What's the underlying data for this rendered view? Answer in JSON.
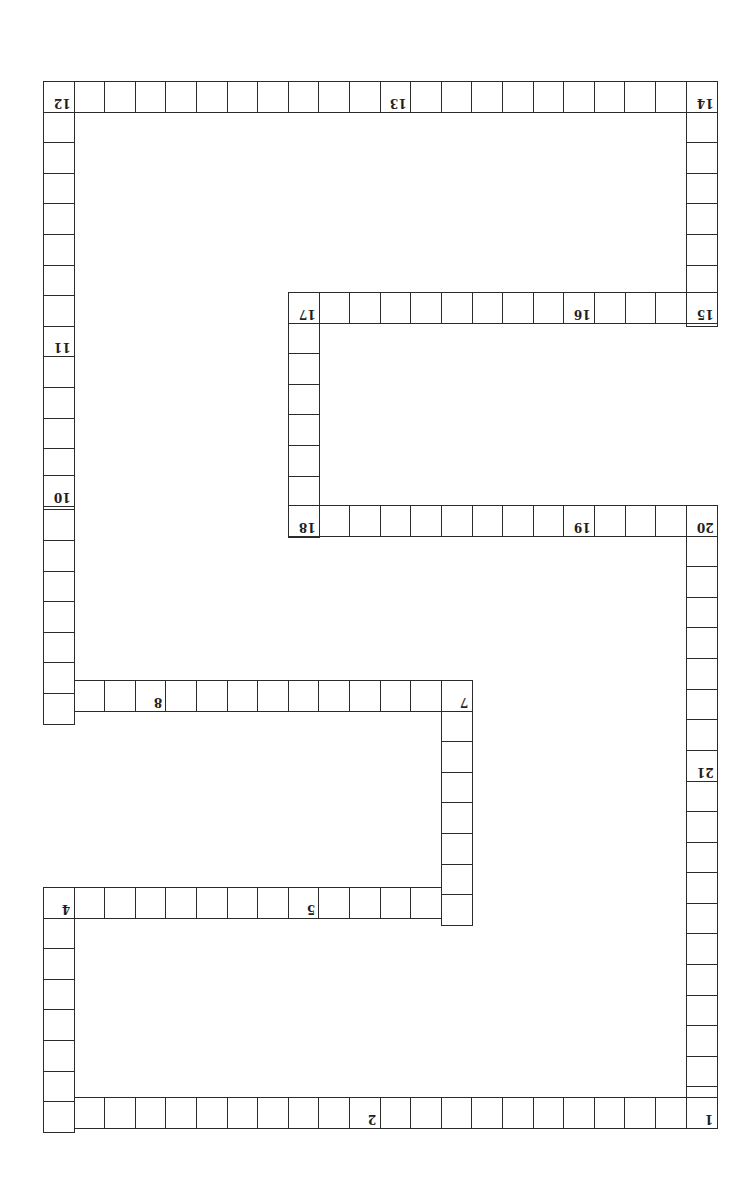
{
  "board": {
    "title": "",
    "orientation": "rotated-180",
    "line_color": "#2b2b2b",
    "background": "#ffffff",
    "cell_size": 30.6,
    "segments": [
      {
        "id": "row-1-3",
        "dir": "h",
        "x": 43,
        "y": 1097,
        "count": 22
      },
      {
        "id": "col-3-4",
        "dir": "v",
        "x": 43,
        "y": 887,
        "count": 8
      },
      {
        "id": "row-4-6",
        "dir": "h",
        "x": 43,
        "y": 887,
        "count": 14
      },
      {
        "id": "col-6-7",
        "dir": "v",
        "x": 441,
        "y": 680,
        "count": 8
      },
      {
        "id": "row-7-9",
        "dir": "h",
        "x": 43,
        "y": 680,
        "count": 14
      },
      {
        "id": "col-9-12",
        "dir": "v",
        "x": 43,
        "y": 81,
        "count": 21
      },
      {
        "id": "row-12-14",
        "dir": "h",
        "x": 43,
        "y": 81,
        "count": 22
      },
      {
        "id": "col-14-15",
        "dir": "v",
        "x": 686,
        "y": 81,
        "count": 8
      },
      {
        "id": "row-15-17",
        "dir": "h",
        "x": 288,
        "y": 292,
        "count": 14
      },
      {
        "id": "col-17-18",
        "dir": "v",
        "x": 288,
        "y": 292,
        "count": 8
      },
      {
        "id": "row-18-20",
        "dir": "h",
        "x": 288,
        "y": 505,
        "count": 14
      },
      {
        "id": "col-20-1",
        "dir": "v",
        "x": 686,
        "y": 505,
        "count": 20
      }
    ],
    "labels": [
      {
        "n": "1",
        "x": 686,
        "y": 1097
      },
      {
        "n": "2",
        "x": 349,
        "y": 1097
      },
      {
        "n": "3",
        "x": 43,
        "y": 1097
      },
      {
        "n": "4",
        "x": 43,
        "y": 887
      },
      {
        "n": "5",
        "x": 288,
        "y": 887
      },
      {
        "n": "6",
        "x": 441,
        "y": 887
      },
      {
        "n": "7",
        "x": 441,
        "y": 680
      },
      {
        "n": "8",
        "x": 135,
        "y": 680
      },
      {
        "n": "9",
        "x": 43,
        "y": 680
      },
      {
        "n": "10",
        "x": 43,
        "y": 475
      },
      {
        "n": "11",
        "x": 43,
        "y": 322
      },
      {
        "n": "12",
        "x": 43,
        "y": 81
      },
      {
        "n": "13",
        "x": 380,
        "y": 81
      },
      {
        "n": "14",
        "x": 686,
        "y": 81
      },
      {
        "n": "15",
        "x": 686,
        "y": 292
      },
      {
        "n": "16",
        "x": 563,
        "y": 292
      },
      {
        "n": "17",
        "x": 288,
        "y": 292
      },
      {
        "n": "18",
        "x": 288,
        "y": 505
      },
      {
        "n": "19",
        "x": 563,
        "y": 505
      },
      {
        "n": "20",
        "x": 686,
        "y": 505
      },
      {
        "n": "21",
        "x": 686,
        "y": 750
      }
    ]
  }
}
